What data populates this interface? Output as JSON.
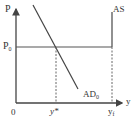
{
  "diagram": {
    "type": "AD-AS diagram",
    "axes": {
      "y_label": "P",
      "x_label": "y",
      "origin_label": "0"
    },
    "price_level": {
      "label": "P",
      "subscript": "0"
    },
    "curves": [
      {
        "name": "AS",
        "label": "AS",
        "subscript": ""
      },
      {
        "name": "AD",
        "label": "AD",
        "subscript": "0"
      }
    ],
    "x_markers": [
      {
        "label": "y*",
        "subscript": ""
      },
      {
        "label": "y",
        "subscript": "f"
      }
    ],
    "colors": {
      "axis": "#444444",
      "curve": "#555555",
      "dashed": "#666666",
      "text": "#333333"
    }
  }
}
